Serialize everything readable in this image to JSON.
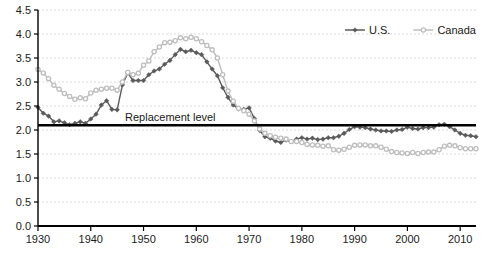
{
  "chart_data": {
    "type": "line",
    "title": "",
    "subtitle": "",
    "xlabel": "",
    "ylabel": "",
    "xlim": [
      1930,
      2013
    ],
    "ylim": [
      0.0,
      4.5
    ],
    "grid": true,
    "legend_position": "top-right",
    "ytick_labels": [
      "0.0",
      "0.5",
      "1.0",
      "1.5",
      "2.0",
      "2.5",
      "3.0",
      "3.5",
      "4.0",
      "4.5"
    ],
    "ytick_values": [
      0.0,
      0.5,
      1.0,
      1.5,
      2.0,
      2.5,
      3.0,
      3.5,
      4.0,
      4.5
    ],
    "xtick_labels": [
      "1930",
      "1940",
      "1950",
      "1960",
      "1970",
      "1980",
      "1990",
      "2000",
      "2010"
    ],
    "xtick_values": [
      1930,
      1940,
      1950,
      1960,
      1970,
      1980,
      1990,
      2000,
      2010
    ],
    "annotations": [
      {
        "text": "Replacement level",
        "x": 1946.5,
        "y": 2.18,
        "kind": "label"
      }
    ],
    "reference_lines": [
      {
        "name": "replacement-level",
        "y": 2.1,
        "color": "#000000",
        "width": 2.5
      }
    ],
    "colors": {
      "us": "#5a5a5a",
      "canada": "#bdbdbd",
      "grid": "#d9d9d9",
      "axis": "#000000",
      "background": "#ffffff"
    },
    "x": [
      1930,
      1931,
      1932,
      1933,
      1934,
      1935,
      1936,
      1937,
      1938,
      1939,
      1940,
      1941,
      1942,
      1943,
      1944,
      1945,
      1946,
      1947,
      1948,
      1949,
      1950,
      1951,
      1952,
      1953,
      1954,
      1955,
      1956,
      1957,
      1958,
      1959,
      1960,
      1961,
      1962,
      1963,
      1964,
      1965,
      1966,
      1967,
      1968,
      1969,
      1970,
      1971,
      1972,
      1973,
      1974,
      1975,
      1976,
      1977,
      1978,
      1979,
      1980,
      1981,
      1982,
      1983,
      1984,
      1985,
      1986,
      1987,
      1988,
      1989,
      1990,
      1991,
      1992,
      1993,
      1994,
      1995,
      1996,
      1997,
      1998,
      1999,
      2000,
      2001,
      2002,
      2003,
      2004,
      2005,
      2006,
      2007,
      2008,
      2009,
      2010,
      2011,
      2012,
      2013
    ],
    "series": [
      {
        "name": "U.S.",
        "color": "#5a5a5a",
        "marker": "diamond",
        "values": [
          2.47,
          2.35,
          2.29,
          2.17,
          2.19,
          2.15,
          2.11,
          2.14,
          2.17,
          2.14,
          2.23,
          2.33,
          2.52,
          2.61,
          2.43,
          2.42,
          2.94,
          3.19,
          3.03,
          3.03,
          3.03,
          3.15,
          3.23,
          3.27,
          3.37,
          3.45,
          3.57,
          3.68,
          3.63,
          3.66,
          3.61,
          3.57,
          3.42,
          3.27,
          3.13,
          2.88,
          2.68,
          2.52,
          2.44,
          2.43,
          2.46,
          2.24,
          1.99,
          1.86,
          1.83,
          1.77,
          1.74,
          1.79,
          1.76,
          1.81,
          1.84,
          1.81,
          1.83,
          1.8,
          1.81,
          1.84,
          1.84,
          1.87,
          1.93,
          2.01,
          2.07,
          2.06,
          2.05,
          2.02,
          2.0,
          1.98,
          1.98,
          1.97,
          2.0,
          2.01,
          2.06,
          2.03,
          2.02,
          2.05,
          2.05,
          2.06,
          2.11,
          2.12,
          2.07,
          2.0,
          1.93,
          1.89,
          1.88,
          1.86
        ]
      },
      {
        "name": "Canada",
        "color": "#bdbdbd",
        "marker": "circle",
        "values": [
          3.26,
          3.19,
          3.07,
          2.93,
          2.85,
          2.76,
          2.7,
          2.64,
          2.67,
          2.65,
          2.77,
          2.83,
          2.85,
          2.87,
          2.87,
          2.83,
          3.0,
          3.2,
          3.15,
          3.18,
          3.35,
          3.44,
          3.63,
          3.73,
          3.82,
          3.83,
          3.86,
          3.92,
          3.9,
          3.93,
          3.9,
          3.84,
          3.76,
          3.67,
          3.5,
          3.15,
          2.81,
          2.6,
          2.45,
          2.4,
          2.33,
          2.19,
          2.02,
          1.93,
          1.88,
          1.85,
          1.83,
          1.81,
          1.76,
          1.76,
          1.74,
          1.7,
          1.69,
          1.68,
          1.66,
          1.67,
          1.59,
          1.58,
          1.6,
          1.64,
          1.68,
          1.69,
          1.69,
          1.67,
          1.67,
          1.64,
          1.6,
          1.55,
          1.53,
          1.52,
          1.51,
          1.53,
          1.51,
          1.53,
          1.54,
          1.54,
          1.59,
          1.66,
          1.68,
          1.67,
          1.63,
          1.61,
          1.61,
          1.61
        ]
      }
    ]
  },
  "legend": {
    "items": [
      {
        "label": "U.S.",
        "color": "#5a5a5a",
        "marker": "diamond"
      },
      {
        "label": "Canada",
        "color": "#bdbdbd",
        "marker": "circle"
      }
    ]
  }
}
